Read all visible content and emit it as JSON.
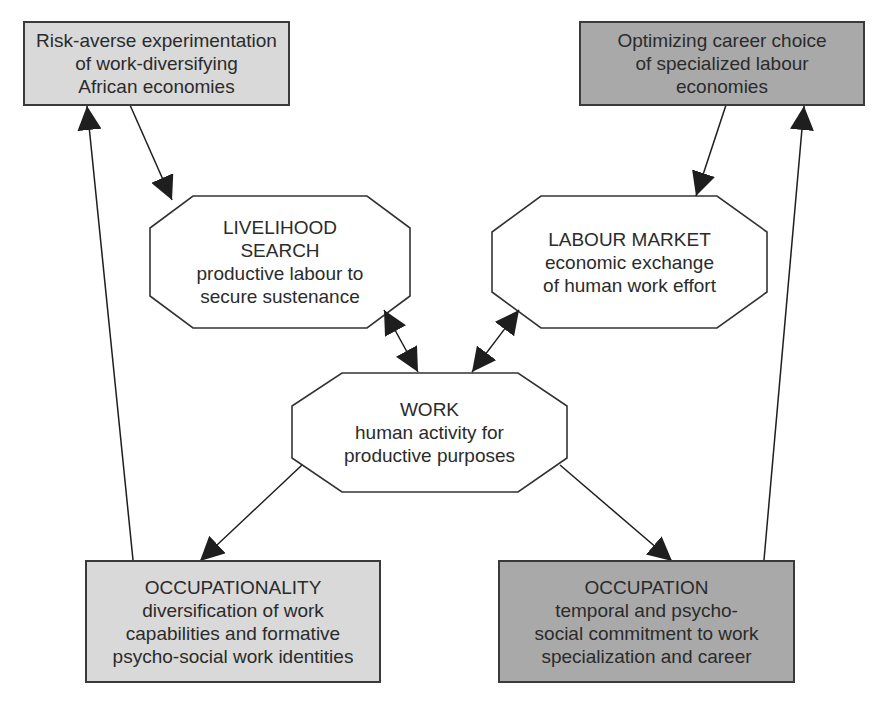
{
  "diagram": {
    "nodes": {
      "risk_averse": {
        "shape": "rectangle",
        "fill": "#d9d9d9",
        "lines": [
          "Risk-averse experimentation",
          "of work-diversifying",
          "African economies"
        ]
      },
      "optimizing": {
        "shape": "rectangle",
        "fill": "#a9a9a9",
        "lines": [
          "Optimizing career choice",
          "of specialized labour",
          "economies"
        ]
      },
      "livelihood": {
        "shape": "octagon",
        "fill": "#ffffff",
        "lines": [
          "LIVELIHOOD",
          "SEARCH",
          "productive labour to",
          "secure sustenance"
        ]
      },
      "labour_market": {
        "shape": "octagon",
        "fill": "#ffffff",
        "lines": [
          "LABOUR MARKET",
          "economic exchange",
          "of human work effort"
        ]
      },
      "work": {
        "shape": "octagon",
        "fill": "#ffffff",
        "lines": [
          "WORK",
          "human activity for",
          "productive purposes"
        ]
      },
      "occupationality": {
        "shape": "rectangle",
        "fill": "#d9d9d9",
        "lines": [
          "OCCUPATIONALITY",
          "diversification of work",
          "capabilities and formative",
          "psycho-social work identities"
        ]
      },
      "occupation": {
        "shape": "rectangle",
        "fill": "#a9a9a9",
        "lines": [
          "OCCUPATION",
          "temporal and psycho-",
          "social commitment to work",
          "specialization and career"
        ]
      }
    },
    "edges": [
      {
        "from": "risk_averse",
        "to": "livelihood",
        "type": "directed"
      },
      {
        "from": "optimizing",
        "to": "labour_market",
        "type": "directed"
      },
      {
        "from": "livelihood",
        "to": "work",
        "type": "bidirectional"
      },
      {
        "from": "labour_market",
        "to": "work",
        "type": "bidirectional"
      },
      {
        "from": "work",
        "to": "occupationality",
        "type": "directed"
      },
      {
        "from": "work",
        "to": "occupation",
        "type": "directed"
      },
      {
        "from": "occupationality",
        "to": "risk_averse",
        "type": "directed"
      },
      {
        "from": "occupation",
        "to": "optimizing",
        "type": "directed"
      }
    ],
    "colors": {
      "stroke": "#2b2b2b",
      "light_fill": "#d9d9d9",
      "dark_fill": "#a9a9a9"
    }
  }
}
